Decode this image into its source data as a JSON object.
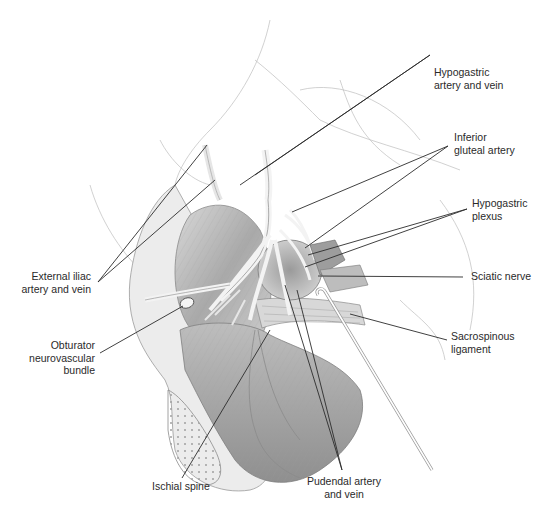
{
  "figure": {
    "colors": {
      "background": "#ffffff",
      "ink": "#2a2a2a",
      "shading_light": "#e4e4e4",
      "shading_mid": "#c2c2c2",
      "shading_dark": "#8c8c8c"
    }
  },
  "labels": {
    "hypogastric_artery_vein": "Hypogastric\nartery and vein",
    "inferior_gluteal_artery": "Inferior\ngluteal artery",
    "hypogastric_plexus": "Hypogastric\nplexus",
    "sciatic_nerve": "Sciatic nerve",
    "sacrospinous_ligament": "Sacrospinous\nligament",
    "external_iliac": "External iliac\nartery and vein",
    "obturator_bundle": "Obturator\nneurovascular\nbundle",
    "ischial_spine": "Ischial spine",
    "pudendal_artery_vein": "Pudendal artery\nand vein"
  }
}
